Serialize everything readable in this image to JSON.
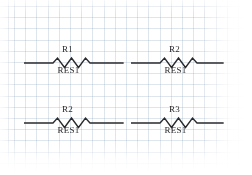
{
  "document": {
    "type": "schematic-drawing",
    "background_color": "#ffffff",
    "grid_color": "#96aac3",
    "ink_color": "#2a2a2e"
  },
  "components": [
    {
      "id": "resistor-r1",
      "symbol": "resistor-zigzag",
      "designator": "R1",
      "value": "RES1",
      "position": {
        "x": 24,
        "y": 44
      }
    },
    {
      "id": "resistor-r2-top",
      "symbol": "resistor-zigzag",
      "designator": "R2",
      "value": "RES1",
      "position": {
        "x": 131,
        "y": 44
      }
    },
    {
      "id": "resistor-r2-bottom",
      "symbol": "resistor-zigzag",
      "designator": "R2",
      "value": "RES1",
      "position": {
        "x": 24,
        "y": 104
      }
    },
    {
      "id": "resistor-r3",
      "symbol": "resistor-zigzag",
      "designator": "R3",
      "value": "RES1",
      "position": {
        "x": 131,
        "y": 104
      }
    }
  ]
}
